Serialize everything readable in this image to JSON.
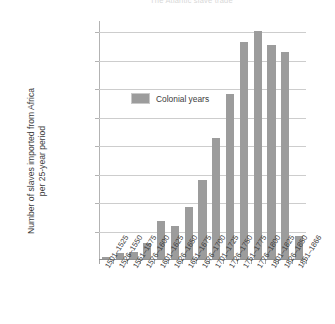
{
  "chart_data": {
    "type": "bar",
    "title": "The Atlantic slave trade",
    "xlabel": "",
    "ylabel": "Number of slaves imported from Africa\nper 25-year period",
    "ylim": [
      0,
      2100000
    ],
    "ytick_step": 250000,
    "yticks": [
      250000,
      500000,
      750000,
      1000000,
      1250000,
      1500000,
      1750000,
      2000000
    ],
    "ytick_labels": [
      "250,000",
      "500,000",
      "750,000",
      "1,000,000",
      "1,250,000",
      "1,500,000",
      "1,750,000",
      "2,000,000"
    ],
    "grid": true,
    "legend": {
      "position": "inside-upper-left",
      "entries": [
        {
          "label": "Colonial years",
          "color": "#9c9c9c"
        }
      ]
    },
    "categories": [
      "1501–1525",
      "1526–1550",
      "1551–1575",
      "1576–1600",
      "1601–1625",
      "1626–1650",
      "1651–1675",
      "1676–1700",
      "1701–1725",
      "1726–1750",
      "1751–1775",
      "1776–1800",
      "1801–1825",
      "1826–1850",
      "1851–1866"
    ],
    "values": [
      20000,
      50000,
      60000,
      140000,
      335000,
      290000,
      455000,
      690000,
      1065000,
      1450000,
      1905000,
      2005000,
      1880000,
      1815000,
      200000
    ],
    "series_name": "Colonial years",
    "bar_color": "#9c9c9c"
  }
}
